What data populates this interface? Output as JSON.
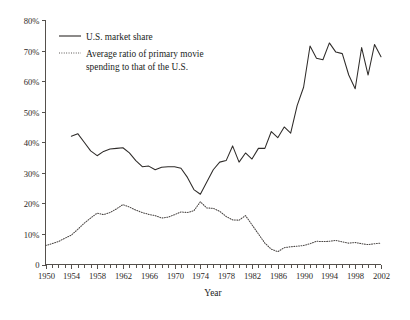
{
  "chart_data": {
    "type": "line",
    "title": "",
    "xlabel": "Year",
    "ylabel": "",
    "xlim": [
      1950,
      2002
    ],
    "ylim": [
      0,
      80
    ],
    "grid": false,
    "legend_position": "top-left",
    "y_ticks": [
      0,
      10,
      20,
      30,
      40,
      50,
      60,
      70,
      80
    ],
    "y_tick_labels": [
      "0",
      "10%",
      "20%",
      "30%",
      "40%",
      "50%",
      "60%",
      "70%",
      "80%"
    ],
    "x_ticks": [
      1950,
      1954,
      1958,
      1962,
      1966,
      1970,
      1974,
      1978,
      1982,
      1986,
      1990,
      1994,
      1998,
      2002
    ],
    "x_tick_labels": [
      "1950",
      "1954",
      "1958",
      "1962",
      "1966",
      "1970",
      "1974",
      "1978",
      "1982",
      "1986",
      "1990",
      "1994",
      "1998",
      "2002"
    ],
    "x_minor_tick_interval": 1,
    "series": [
      {
        "name": "U.S. market share",
        "style": "solid",
        "color": "#2e2b29",
        "x": [
          1954,
          1955,
          1956,
          1957,
          1958,
          1959,
          1960,
          1961,
          1962,
          1963,
          1964,
          1965,
          1966,
          1967,
          1968,
          1969,
          1970,
          1971,
          1972,
          1973,
          1974,
          1975,
          1976,
          1977,
          1978,
          1979,
          1980,
          1981,
          1982,
          1983,
          1984,
          1985,
          1986,
          1987,
          1988,
          1989,
          1990,
          1991,
          1992,
          1993,
          1994,
          1995,
          1996,
          1997,
          1998,
          1999,
          2000,
          2001,
          2002
        ],
        "values": [
          42.0,
          42.8,
          40.0,
          37.2,
          35.6,
          37.0,
          37.8,
          38.0,
          38.2,
          36.5,
          34.0,
          32.0,
          32.2,
          31.0,
          31.8,
          32.0,
          32.0,
          31.5,
          28.5,
          24.5,
          23.0,
          27.0,
          31.0,
          33.5,
          34.0,
          38.8,
          33.5,
          36.5,
          34.5,
          38.0,
          38.0,
          43.5,
          41.5,
          45.0,
          43.0,
          52.0,
          58.0,
          71.5,
          67.5,
          67.0,
          72.5,
          69.5,
          69.0,
          62.0,
          57.5,
          71.0,
          62.0,
          72.0,
          68.0
        ]
      },
      {
        "name": "Average ratio of primary movie spending to that of the U.S.",
        "style": "dotted",
        "color": "#4a4644",
        "x": [
          1950,
          1951,
          1952,
          1953,
          1954,
          1955,
          1956,
          1957,
          1958,
          1959,
          1960,
          1961,
          1962,
          1963,
          1964,
          1965,
          1966,
          1967,
          1968,
          1969,
          1970,
          1971,
          1972,
          1973,
          1974,
          1975,
          1976,
          1977,
          1978,
          1979,
          1980,
          1981,
          1982,
          1983,
          1984,
          1985,
          1986,
          1987,
          1988,
          1989,
          1990,
          1991,
          1992,
          1993,
          1994,
          1995,
          1996,
          1997,
          1998,
          1999,
          2000,
          2001,
          2002
        ],
        "values": [
          6.2,
          6.8,
          7.5,
          8.6,
          9.6,
          11.5,
          13.5,
          15.2,
          16.8,
          16.3,
          17.0,
          18.2,
          19.6,
          18.8,
          17.8,
          17.0,
          16.4,
          16.0,
          15.2,
          15.5,
          16.3,
          17.2,
          17.0,
          17.6,
          20.5,
          18.5,
          18.4,
          17.4,
          15.7,
          14.6,
          14.5,
          16.0,
          13.0,
          10.0,
          7.0,
          5.0,
          4.2,
          5.5,
          5.8,
          6.0,
          6.2,
          6.8,
          7.6,
          7.5,
          7.6,
          7.9,
          7.4,
          7.0,
          7.2,
          6.8,
          6.5,
          6.8,
          7.0
        ]
      }
    ]
  },
  "legend": {
    "entries": [
      {
        "label": "U.S. market share",
        "style": "solid"
      },
      {
        "label": "Average ratio of primary movie",
        "style": "dotted"
      },
      {
        "label": "spending to that of the U.S.",
        "style": "none"
      }
    ]
  }
}
